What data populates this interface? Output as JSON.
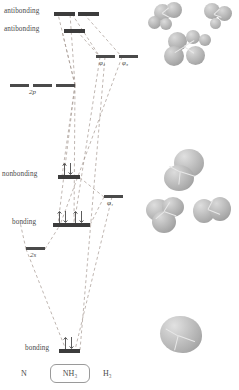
{
  "diagram": {
    "footer": {
      "left_label": "N",
      "center_label": "NH₃",
      "right_label": "H₃"
    },
    "atomic_orbitals": [
      {
        "name": "2p-level-1",
        "label": "",
        "x": 10,
        "y": 84,
        "w": 19
      },
      {
        "name": "2p-level-2",
        "label": "",
        "x": 33,
        "y": 84,
        "w": 19
      },
      {
        "name": "2p-level-3",
        "label": "",
        "x": 56,
        "y": 84,
        "w": 19
      },
      {
        "name": "2s-level",
        "label": "",
        "x": 26,
        "y": 247,
        "w": 19
      }
    ],
    "ao_labels": [
      {
        "name": "label-2p",
        "text": "2p",
        "x": 29,
        "y": 89
      },
      {
        "name": "label-2s",
        "text": "2s",
        "x": 30,
        "y": 252
      }
    ],
    "molecular_orbitals": [
      {
        "name": "antibonding-upper-a",
        "x": 54,
        "y": 12,
        "w": 21,
        "electrons": 0
      },
      {
        "name": "antibonding-upper-b",
        "x": 66,
        "y": 12,
        "w": 21,
        "electrons": 0
      },
      {
        "name": "antibonding-lower",
        "x": 58,
        "y": 29,
        "w": 21,
        "electrons": 0
      },
      {
        "name": "nonbonding",
        "x": 58,
        "y": 175,
        "w": 21,
        "electrons": 2
      },
      {
        "name": "bonding-mid-a",
        "x": 53,
        "y": 223,
        "w": 21,
        "electrons": 2
      },
      {
        "name": "bonding-mid-b",
        "x": 69,
        "y": 223,
        "w": 21,
        "electrons": 2
      },
      {
        "name": "bonding-lowest",
        "x": 59,
        "y": 349,
        "w": 21,
        "electrons": 2
      }
    ],
    "mo_labels": [
      {
        "name": "label-antibonding-upper",
        "text": "antibonding",
        "x": 5,
        "y": 8
      },
      {
        "name": "label-antibonding-lower",
        "text": "antibonding",
        "x": 5,
        "y": 26
      },
      {
        "name": "label-nonbonding",
        "text": "nonbonding",
        "x": 5,
        "y": 171
      },
      {
        "name": "label-bonding-mid",
        "text": "bonding",
        "x": 10,
        "y": 218
      },
      {
        "name": "label-bonding-lowest",
        "text": "bonding",
        "x": 23,
        "y": 344
      }
    ],
    "fragment_orbitals": [
      {
        "name": "phi2-level",
        "x": 96,
        "y": 55,
        "w": 19
      },
      {
        "name": "phi3-level",
        "x": 118,
        "y": 55,
        "w": 19
      },
      {
        "name": "phi1-level",
        "x": 104,
        "y": 195,
        "w": 19
      }
    ],
    "fragment_labels": [
      {
        "name": "label-phi2",
        "text": "φ₂",
        "x": 99,
        "y": 60
      },
      {
        "name": "label-phi3",
        "text": "φ₃",
        "x": 121,
        "y": 60
      },
      {
        "name": "label-phi1",
        "text": "φ₁",
        "x": 107,
        "y": 200
      }
    ],
    "orbital_renderings": [
      {
        "name": "orbital-image-antibonding",
        "caption": "antibonding MO isosurface cluster"
      },
      {
        "name": "orbital-image-nonbonding-bonding",
        "caption": "nonbonding and bonding MO isosurfaces"
      },
      {
        "name": "orbital-image-lowest-bonding",
        "caption": "lowest bonding MO isosurface"
      }
    ],
    "colors": {
      "level": "#4a4a4a",
      "text": "#4a4a4a",
      "dashed_line": "#9b8f8a",
      "lobe": "#b9b9b9",
      "background": "#ffffff"
    }
  }
}
